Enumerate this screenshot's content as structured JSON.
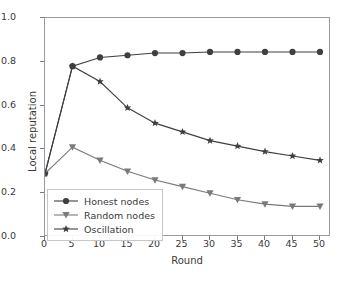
{
  "chart_data": {
    "type": "line",
    "title": "",
    "xlabel": "Round",
    "ylabel": "Local reputation",
    "xlim": [
      0,
      52
    ],
    "ylim": [
      0.0,
      1.0
    ],
    "grid": false,
    "legend_position": "lower left",
    "x": [
      0,
      5,
      10,
      15,
      20,
      25,
      30,
      35,
      40,
      45,
      50
    ],
    "xticks": [
      "0",
      "5",
      "10",
      "15",
      "20",
      "25",
      "30",
      "35",
      "40",
      "45",
      "50"
    ],
    "yticks": [
      "0.0",
      "0.2",
      "0.4",
      "0.6",
      "0.8",
      "1.0"
    ],
    "series": [
      {
        "name": "Honest nodes",
        "marker": "circle",
        "color": "#3f3f3f",
        "values": [
          0.29,
          0.78,
          0.82,
          0.83,
          0.84,
          0.84,
          0.845,
          0.845,
          0.845,
          0.845,
          0.845
        ]
      },
      {
        "name": "Random nodes",
        "marker": "triangle-down",
        "color": "#7a7a7a",
        "values": [
          0.29,
          0.41,
          0.35,
          0.3,
          0.26,
          0.23,
          0.2,
          0.17,
          0.15,
          0.14,
          0.14
        ]
      },
      {
        "name": "Oscillation",
        "marker": "star",
        "color": "#3f3f3f",
        "values": [
          0.29,
          0.78,
          0.71,
          0.59,
          0.52,
          0.48,
          0.44,
          0.415,
          0.39,
          0.37,
          0.35
        ]
      }
    ]
  }
}
